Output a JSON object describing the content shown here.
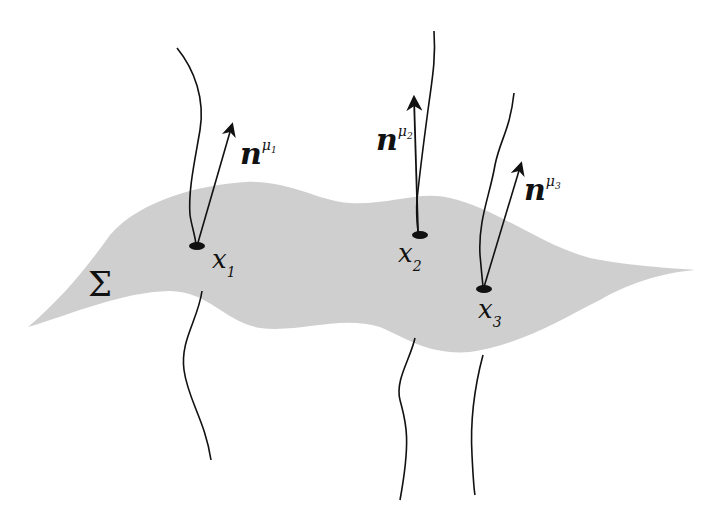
{
  "diagram": {
    "surface": {
      "label": "Σ",
      "fill": "#cfcfcf"
    },
    "points": [
      {
        "name": "x",
        "subscript": "1",
        "normal_label": "n",
        "normal_superscript": "μ",
        "normal_superscript_sub": "1"
      },
      {
        "name": "x",
        "subscript": "2",
        "normal_label": "n",
        "normal_superscript": "μ",
        "normal_superscript_sub": "2"
      },
      {
        "name": "x",
        "subscript": "3",
        "normal_label": "n",
        "normal_superscript": "μ",
        "normal_superscript_sub": "3"
      }
    ],
    "colors": {
      "ink": "#111111",
      "background": "#ffffff"
    }
  }
}
